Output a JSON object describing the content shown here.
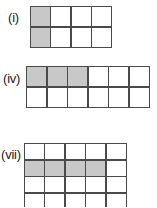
{
  "page": {
    "background_color": "#ffffff",
    "shaded_color": "#c8c8c8",
    "border_color": "#4a4a4a",
    "cell_color": "#ffffff"
  },
  "figures": [
    {
      "id": "i",
      "label": "(i)",
      "columns": 4,
      "rows": 2,
      "total_cells": 8,
      "shaded_count": 2,
      "fraction": "2/8",
      "shaded_description": "first column shaded, both rows",
      "cells": [
        [
          1,
          0,
          0,
          0
        ],
        [
          1,
          0,
          0,
          0
        ]
      ]
    },
    {
      "id": "iv",
      "label": "(iv)",
      "columns": 6,
      "rows": 2,
      "total_cells": 12,
      "shaded_count": 3,
      "fraction": "3/12",
      "shaded_description": "first three cells of the top row shaded",
      "cells": [
        [
          1,
          1,
          1,
          0,
          0,
          0
        ],
        [
          0,
          0,
          0,
          0,
          0,
          0
        ]
      ]
    },
    {
      "id": "vii",
      "label": "(vii)",
      "columns": 5,
      "rows": 4,
      "total_cells": 20,
      "shaded_count": 4,
      "fraction": "4/20",
      "shaded_description": "first four cells of the second row shaded; bottom row clipped by image edge",
      "cells": [
        [
          0,
          0,
          0,
          0,
          0
        ],
        [
          1,
          1,
          1,
          1,
          0
        ],
        [
          0,
          0,
          0,
          0,
          0
        ],
        [
          0,
          0,
          0,
          0,
          0
        ]
      ]
    }
  ]
}
